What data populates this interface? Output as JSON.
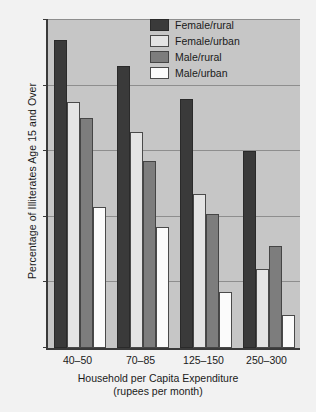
{
  "chart_data": {
    "type": "bar",
    "title": "",
    "xlabel": "Household per Capita Expenditure",
    "xlabel_sub": "(rupees per month)",
    "ylabel": "Percentage of Illiterates Age 15 and Over",
    "categories": [
      "40–50",
      "70–85",
      "125–150",
      "250–300"
    ],
    "ylim": [
      0,
      100
    ],
    "yticks": [
      0,
      20,
      40,
      60,
      80,
      100
    ],
    "ytick_labels": [
      "0",
      "20",
      "40",
      "60",
      "80",
      "100"
    ],
    "grid": true,
    "legend_position": "top-right",
    "series": [
      {
        "name": "Female/rural",
        "color": "#3a3a3a",
        "values": [
          94,
          86,
          76,
          60
        ]
      },
      {
        "name": "Female/urban",
        "color": "#e4e4e4",
        "values": [
          75,
          66,
          47,
          24
        ]
      },
      {
        "name": "Male/rural",
        "color": "#7d7d7d",
        "values": [
          70,
          57,
          41,
          31
        ]
      },
      {
        "name": "Male/urban",
        "color": "#fbfbfb",
        "values": [
          43,
          37,
          17,
          10
        ]
      }
    ]
  }
}
